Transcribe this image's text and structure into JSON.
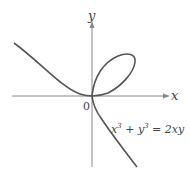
{
  "diagram": {
    "axes": {
      "x_label": "x",
      "y_label": "y",
      "origin_label": "0"
    },
    "equation": {
      "lhs_term1_base": "x",
      "lhs_term1_exp": "3",
      "plus": " + ",
      "lhs_term2_base": "y",
      "lhs_term2_exp": "3",
      "rhs": " = 2xy"
    },
    "colors": {
      "curve": "#555555",
      "axes": "#888888",
      "text": "#444444"
    }
  }
}
